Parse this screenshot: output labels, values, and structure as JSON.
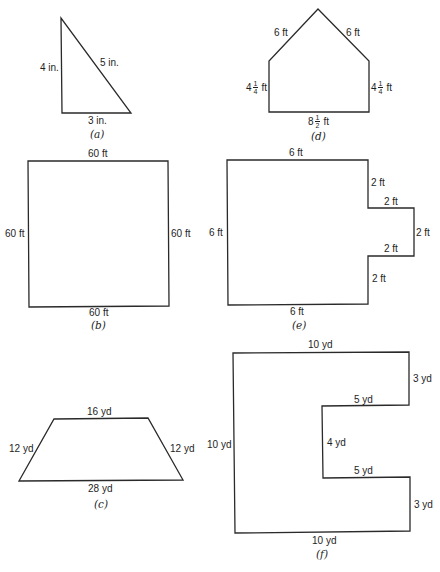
{
  "figures": {
    "a": {
      "caption": "(a)",
      "shape": "right-triangle",
      "labels": {
        "left": "4 in.",
        "hypotenuse": "5 in.",
        "bottom": "3 in."
      }
    },
    "b": {
      "caption": "(b)",
      "shape": "square",
      "labels": {
        "top": "60 ft",
        "left": "60 ft",
        "right": "60 ft",
        "bottom": "60 ft"
      }
    },
    "c": {
      "caption": "(c)",
      "shape": "isosceles-trapezoid",
      "labels": {
        "top": "16 yd",
        "left": "12 yd",
        "right": "12 yd",
        "bottom": "28 yd"
      }
    },
    "d": {
      "caption": "(d)",
      "shape": "house-pentagon",
      "labels": {
        "roof_left": "6 ft",
        "roof_right": "6 ft",
        "left_whole": "4",
        "left_num": "1",
        "left_den": "4",
        "left_unit": "ft",
        "right_whole": "4",
        "right_num": "1",
        "right_den": "4",
        "right_unit": "ft",
        "bottom_whole": "8",
        "bottom_num": "1",
        "bottom_den": "2",
        "bottom_unit": "ft"
      }
    },
    "e": {
      "caption": "(e)",
      "shape": "rectangle-with-tab",
      "labels": {
        "top": "6 ft",
        "left": "6 ft",
        "bottom": "6 ft",
        "right_upper": "2 ft",
        "tab_top": "2 ft",
        "tab_right": "2 ft",
        "tab_bottom": "2 ft",
        "right_lower": "2 ft"
      }
    },
    "f": {
      "caption": "(f)",
      "shape": "c-shape",
      "labels": {
        "top": "10 yd",
        "right_upper": "3 yd",
        "notch_top": "5 yd",
        "notch_inner": "4 yd",
        "notch_bottom": "5 yd",
        "right_lower": "3 yd",
        "bottom": "10 yd",
        "left": "10 yd"
      }
    }
  },
  "colors": {
    "stroke": "#2a2a2a",
    "text": "#1e1e1e",
    "background": "#ffffff"
  }
}
